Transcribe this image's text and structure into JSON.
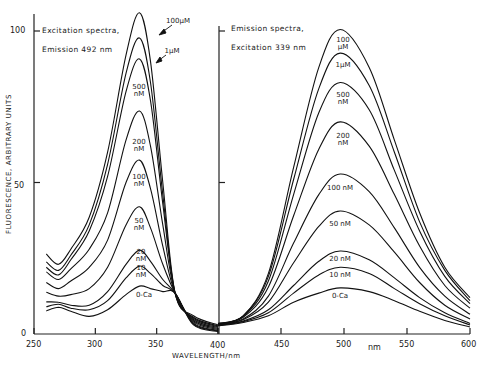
{
  "chart_data": {
    "type": "line",
    "ylabel": "FLUORESCENCE, ARBITRARY UNITS",
    "xlabel": "WAVELENGTH/nm",
    "xunit_label": "nm",
    "ylim": [
      0,
      110
    ],
    "yticks": [
      "0",
      "50",
      "100"
    ],
    "grid": false,
    "legend": "inline curve labels",
    "panels": [
      {
        "name": "excitation",
        "title_line1": "Excitation spectra,",
        "title_line2": "Emission 492 nm",
        "xlim": [
          250,
          400
        ],
        "xticks": [
          "250",
          "300",
          "350",
          "400"
        ],
        "x": [
          260,
          270,
          280,
          295,
          310,
          325,
          336,
          345,
          355,
          365,
          380,
          400
        ],
        "series": [
          {
            "name": "100 µM",
            "values": [
              26.4,
              23,
              28,
              38.5,
              60,
              92,
              106,
              90,
              50,
              13.5,
              6,
              3
            ]
          },
          {
            "name": "1 µM",
            "values": [
              23.8,
              21,
              26,
              36,
              56,
              86,
              97.7,
              83,
              46,
              13.5,
              5.5,
              2.7
            ]
          },
          {
            "name": "500 nM",
            "values": [
              22,
              19.5,
              24.5,
              34,
              52,
              80,
              90.8,
              77,
              43,
              13.5,
              5.2,
              2.4
            ]
          },
          {
            "name": "200 nM",
            "values": [
              20.5,
              18,
              21.5,
              28,
              40,
              64,
              73.6,
              62,
              36,
              13.5,
              4.8,
              2.1
            ]
          },
          {
            "name": "100 nM",
            "values": [
              17,
              15,
              17.5,
              22,
              31,
              50,
              57.4,
              48,
              29,
              13.5,
              4.4,
              1.8
            ]
          },
          {
            "name": "50 nM",
            "values": [
              13.8,
              12.5,
              13,
              15,
              22,
              36,
              42,
              35,
              23,
              13.5,
              4,
              1.5
            ]
          },
          {
            "name": "20 nM",
            "values": [
              10.6,
              10.5,
              9.5,
              9.5,
              14,
              23,
              27.7,
              24,
              18,
              13.5,
              3.6,
              1.2
            ]
          },
          {
            "name": "10 nM",
            "values": [
              9,
              9.8,
              8.5,
              8,
              11,
              18.5,
              22.4,
              20,
              16,
              13.5,
              3.3,
              1
            ]
          },
          {
            "name": "0-Ca",
            "values": [
              7.6,
              8.8,
              7.5,
              5.8,
              8,
              13,
              15.8,
              15,
              14,
              13.5,
              3,
              0.8
            ]
          }
        ],
        "labels": [
          {
            "text": "100µM",
            "x": 178,
            "y": 22
          },
          {
            "text": "1µM",
            "x": 172,
            "y": 52
          },
          {
            "text": "500\nnM",
            "x": 139,
            "y": 88
          },
          {
            "text": "200\nnM",
            "x": 139,
            "y": 143
          },
          {
            "text": "100\nnM",
            "x": 139,
            "y": 178
          },
          {
            "text": "50\nnM",
            "x": 139,
            "y": 222
          },
          {
            "text": "20\nnM",
            "x": 141,
            "y": 253
          },
          {
            "text": "10\nnM",
            "x": 141,
            "y": 269
          },
          {
            "text": "0-Ca",
            "x": 144,
            "y": 296
          }
        ]
      },
      {
        "name": "emission",
        "title_line1": "Emission spectra,",
        "title_line2": "Excitation 339 nm",
        "xlim": [
          400,
          600
        ],
        "xticks": [
          "400",
          "450",
          "500",
          "550",
          "600"
        ],
        "x": [
          400,
          420,
          440,
          460,
          480,
          497,
          520,
          540,
          560,
          580,
          600
        ],
        "series": [
          {
            "name": "100 µM",
            "values": [
              3.5,
              6,
              20,
              55,
              88,
              100.5,
              88,
              64,
              40,
              22,
              12
            ]
          },
          {
            "name": "1 µM",
            "values": [
              3.4,
              6,
              19,
              51,
              81,
              92.7,
              82,
              60,
              37,
              21,
              11
            ]
          },
          {
            "name": "500 nM",
            "values": [
              3.3,
              5.8,
              17.5,
              46,
              73,
              83,
              74,
              54,
              34,
              19,
              10
            ]
          },
          {
            "name": "200 nM",
            "values": [
              3.2,
              5.5,
              15.5,
              39,
              61,
              70,
              62,
              46,
              29,
              16,
              8.5
            ]
          },
          {
            "name": "100 nM",
            "values": [
              3.1,
              5,
              12.5,
              30,
              46,
              52.8,
              47,
              35,
              22,
              12.5,
              6.5
            ]
          },
          {
            "name": "50 nM",
            "values": [
              3,
              4.7,
              10.5,
              23.5,
              35.5,
              40.6,
              36,
              27,
              17,
              9.5,
              5
            ]
          },
          {
            "name": "20 nM",
            "values": [
              2.9,
              4.3,
              8,
              16,
              24,
              27.4,
              24.5,
              18.5,
              12,
              7,
              3.5
            ]
          },
          {
            "name": "10 nM",
            "values": [
              2.8,
              4.1,
              7,
              13.5,
              19.5,
              22,
              20,
              15,
              10,
              6,
              3
            ]
          },
          {
            "name": "0-Ca",
            "values": [
              2.7,
              3.8,
              6,
              10.5,
              13.5,
              15.2,
              14,
              11,
              7.5,
              4.5,
              2.3
            ]
          }
        ],
        "labels": [
          {
            "text": "100\nµM",
            "x": 343,
            "y": 41
          },
          {
            "text": "1µM",
            "x": 343,
            "y": 66
          },
          {
            "text": "500\nnM",
            "x": 343,
            "y": 96
          },
          {
            "text": "200\nnM",
            "x": 343,
            "y": 137
          },
          {
            "text": "100 nM",
            "x": 340,
            "y": 189
          },
          {
            "text": "50 nM",
            "x": 340,
            "y": 225
          },
          {
            "text": "20 nM",
            "x": 340,
            "y": 260
          },
          {
            "text": "10 nM",
            "x": 340,
            "y": 276
          },
          {
            "text": "0-Ca",
            "x": 340,
            "y": 297
          }
        ]
      }
    ]
  }
}
